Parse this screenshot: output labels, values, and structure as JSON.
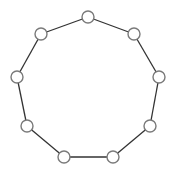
{
  "diagram": {
    "type": "cycle-graph",
    "node_count": 9,
    "node_radius": 6,
    "colors": {
      "background": "#ffffff",
      "edge": "#333333",
      "node_fill": "#ffffff",
      "node_stroke": "#7a7a7a"
    },
    "nodes": [
      {
        "id": "n0",
        "x": 88,
        "y": 17
      },
      {
        "id": "n1",
        "x": 134,
        "y": 34
      },
      {
        "id": "n2",
        "x": 159,
        "y": 77
      },
      {
        "id": "n3",
        "x": 150,
        "y": 126
      },
      {
        "id": "n4",
        "x": 113,
        "y": 157
      },
      {
        "id": "n5",
        "x": 64,
        "y": 157
      },
      {
        "id": "n6",
        "x": 27,
        "y": 126
      },
      {
        "id": "n7",
        "x": 17,
        "y": 77
      },
      {
        "id": "n8",
        "x": 41,
        "y": 34
      }
    ],
    "edges": [
      [
        "n0",
        "n1"
      ],
      [
        "n1",
        "n2"
      ],
      [
        "n2",
        "n3"
      ],
      [
        "n3",
        "n4"
      ],
      [
        "n4",
        "n5"
      ],
      [
        "n5",
        "n6"
      ],
      [
        "n6",
        "n7"
      ],
      [
        "n7",
        "n8"
      ],
      [
        "n8",
        "n0"
      ]
    ]
  }
}
